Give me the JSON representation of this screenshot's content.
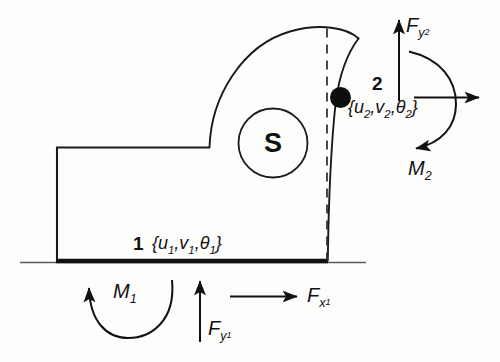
{
  "figure": {
    "background_color": "#fdfdfc",
    "line_color": "#1a1a1a"
  },
  "body_label": {
    "centroid_symbol": "S"
  },
  "nodes": [
    {
      "id": "node-1",
      "number": "1",
      "dof_label": "{u",
      "dof_full": "{u1,v1,θ1}",
      "sub1": "1",
      "mid": ",v",
      "sub2": "1",
      "theta": ",θ",
      "sub3": "1",
      "close": "}"
    },
    {
      "id": "node-2",
      "number": "2",
      "dof_full": "{u2,v2,θ2}",
      "open": "{u",
      "sub1": "2",
      "mid": ",v",
      "sub2": "2",
      "theta": ",θ",
      "sub3": "2",
      "close": "}"
    }
  ],
  "forces": [
    {
      "id": "moment-1",
      "symbol": "M",
      "subscript": "1",
      "kind": "moment",
      "direction": "counterclockwise"
    },
    {
      "id": "force-y-1",
      "symbol": "F",
      "subscript": "y",
      "subscript2": "1",
      "kind": "force",
      "direction": "up"
    },
    {
      "id": "force-x-1",
      "symbol": "F",
      "subscript": "x",
      "subscript2": "1",
      "kind": "force",
      "direction": "right"
    },
    {
      "id": "force-y-2",
      "symbol": "F",
      "subscript": "y",
      "subscript2": "2",
      "kind": "force",
      "direction": "up"
    },
    {
      "id": "force-x-2",
      "symbol": "",
      "subscript": "",
      "kind": "force",
      "direction": "right"
    },
    {
      "id": "moment-2",
      "symbol": "M",
      "subscript": "2",
      "kind": "moment",
      "direction": "clockwise"
    }
  ]
}
